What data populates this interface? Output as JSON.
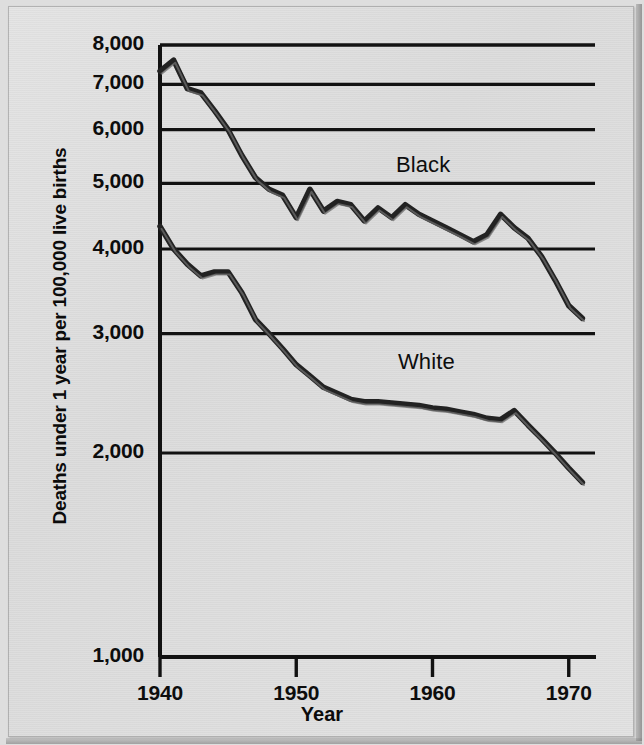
{
  "figure": {
    "background_color": "#dedede",
    "ink_color": "#111111",
    "line_color": "#2b2b2b"
  },
  "axes": {
    "y_axis_title": "Deaths under 1 year per 100,000 live births",
    "x_axis_title": "Year",
    "y_tick_labels": [
      "8,000",
      "7,000",
      "6,000",
      "5,000",
      "4,000",
      "3,000",
      "2,000",
      "1,000"
    ],
    "x_tick_labels": [
      "1940",
      "1950",
      "1960",
      "1970"
    ]
  },
  "series_labels": {
    "black": "Black",
    "white": "White"
  },
  "chart_data": {
    "type": "line",
    "title": "",
    "subtitle": "",
    "xlabel": "Year",
    "ylabel": "Deaths under 1 year per 100,000 live births",
    "yscale": "log",
    "ylim": [
      1000,
      8000
    ],
    "xlim": [
      1940,
      1972
    ],
    "ytick_values": [
      8000,
      7000,
      6000,
      5000,
      4000,
      3000,
      2000,
      1000
    ],
    "xtick_values": [
      1940,
      1950,
      1960,
      1970
    ],
    "grid": true,
    "grid_axis": "y",
    "legend": "inline-annotations",
    "annotations": [
      {
        "text": "Black",
        "x": 1959.0,
        "y": 5450
      },
      {
        "text": "White",
        "x": 1959.2,
        "y": 2680
      }
    ],
    "x": [
      1940,
      1941,
      1942,
      1943,
      1944,
      1945,
      1946,
      1947,
      1948,
      1949,
      1950,
      1951,
      1952,
      1953,
      1954,
      1955,
      1956,
      1957,
      1958,
      1959,
      1960,
      1961,
      1962,
      1963,
      1964,
      1965,
      1966,
      1967,
      1968,
      1969,
      1970,
      1971
    ],
    "series": [
      {
        "name": "Black",
        "values": [
          7320,
          7600,
          6900,
          6800,
          6400,
          6000,
          5500,
          5100,
          4900,
          4800,
          4450,
          4900,
          4550,
          4700,
          4650,
          4400,
          4600,
          4450,
          4650,
          4500,
          4400,
          4300,
          4200,
          4100,
          4200,
          4500,
          4300,
          4150,
          3900,
          3600,
          3300,
          3160
        ]
      },
      {
        "name": "White",
        "values": [
          4320,
          4000,
          3800,
          3650,
          3700,
          3700,
          3450,
          3150,
          3000,
          2850,
          2700,
          2600,
          2500,
          2450,
          2400,
          2380,
          2380,
          2370,
          2360,
          2350,
          2330,
          2320,
          2300,
          2280,
          2250,
          2240,
          2310,
          2200,
          2100,
          2000,
          1900,
          1810
        ]
      }
    ]
  }
}
